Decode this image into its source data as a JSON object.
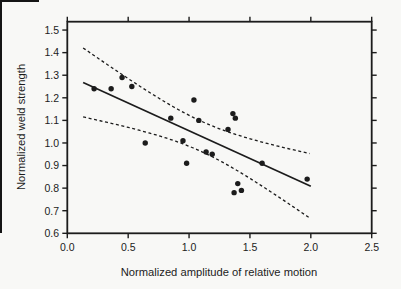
{
  "colors": {
    "ink": "#1c1c1c",
    "paper": "#f8f8f6"
  },
  "chart_data": {
    "type": "scatter",
    "title": "",
    "xlabel": "Normalized amplitude of relative motion",
    "ylabel": "Normalized weld strength",
    "xlim": [
      0,
      2.5
    ],
    "ylim": [
      0.6,
      1.537
    ],
    "xticks": [
      0.0,
      0.5,
      1.0,
      1.5,
      2.0,
      2.5
    ],
    "yticks": [
      0.6,
      0.7,
      0.8,
      0.9,
      1.0,
      1.1,
      1.2,
      1.3,
      1.4,
      1.5
    ],
    "grid": false,
    "legend": "none",
    "points": [
      [
        0.22,
        1.24
      ],
      [
        0.36,
        1.24
      ],
      [
        0.45,
        1.29
      ],
      [
        0.53,
        1.25
      ],
      [
        0.64,
        1.0
      ],
      [
        0.85,
        1.11
      ],
      [
        0.95,
        1.01
      ],
      [
        0.98,
        0.91
      ],
      [
        1.04,
        1.19
      ],
      [
        1.08,
        1.1
      ],
      [
        1.14,
        0.96
      ],
      [
        1.19,
        0.95
      ],
      [
        1.32,
        1.06
      ],
      [
        1.36,
        1.13
      ],
      [
        1.38,
        1.11
      ],
      [
        1.37,
        0.78
      ],
      [
        1.4,
        0.82
      ],
      [
        1.43,
        0.79
      ],
      [
        1.6,
        0.91
      ],
      [
        1.97,
        0.84
      ]
    ],
    "fit_line": {
      "intercept": 1.3,
      "slope": -0.246,
      "x_start": 0.13,
      "x_end": 2.0,
      "style": "solid"
    },
    "confidence_band": {
      "style": "dashed",
      "center_x": 1.1,
      "a": 0.0045,
      "b": 0.02,
      "x_start": 0.13,
      "x_end": 2.0,
      "upper_start_y": 1.42,
      "upper_end_y": 0.95,
      "lower_start_y": 1.12,
      "lower_end_y": 0.67
    }
  }
}
